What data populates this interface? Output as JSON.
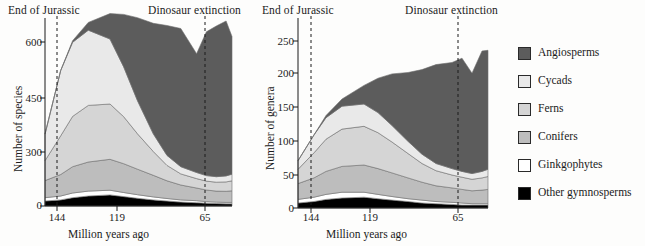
{
  "figure": {
    "axis_x_title": "Million years ago",
    "event_end_jurassic": "End of Jurassic",
    "event_dinosaur_extinction": "Dinosaur extinction",
    "panel_a_letter": "(a)",
    "panel_b_letter": "(b)"
  },
  "legend": {
    "items": [
      {
        "label": "Angiosperms",
        "color": "#5c5c5c",
        "key": "angiosperms"
      },
      {
        "label": "Cycads",
        "color": "#e9e9e9",
        "key": "cycads"
      },
      {
        "label": "Ferns",
        "color": "#d5d5d5",
        "key": "ferns"
      },
      {
        "label": "Conifers",
        "color": "#bdbdbd",
        "key": "conifers"
      },
      {
        "label": "Ginkgophytes",
        "color": "#ffffff",
        "key": "ginkgophytes"
      },
      {
        "label": "Other gymnosperms",
        "color": "#000000",
        "key": "other_gymnosperms"
      }
    ]
  },
  "chart_data": [
    {
      "id": "panel-a",
      "type": "area",
      "stacked": true,
      "title": "",
      "panel_label": "(a)",
      "xlabel": "Million years ago",
      "ylabel": "Number of species",
      "x_reversed": true,
      "xlim": [
        152,
        57
      ],
      "ylim": [
        0,
        680
      ],
      "grid": false,
      "legend_position": "right-outside",
      "xticks": [
        144,
        119,
        65
      ],
      "yticks": [
        0,
        300,
        450,
        600
      ],
      "annotations": [
        {
          "text": "End of Jurassic",
          "x": 144,
          "style": "dashed-vline"
        },
        {
          "text": "Dinosaur extinction",
          "x": 65,
          "style": "dashed-vline"
        }
      ],
      "x": [
        152,
        144,
        138,
        130,
        119,
        112,
        105,
        97,
        90,
        83,
        75,
        70,
        65,
        60,
        57
      ],
      "series": [
        {
          "name": "Other gymnosperms",
          "values": [
            18,
            22,
            30,
            36,
            40,
            34,
            28,
            22,
            18,
            14,
            12,
            10,
            9,
            8,
            8
          ]
        },
        {
          "name": "Ginkgophytes",
          "values": [
            12,
            14,
            17,
            18,
            17,
            15,
            13,
            11,
            9,
            8,
            7,
            6,
            5,
            5,
            5
          ]
        },
        {
          "name": "Conifers",
          "values": [
            62,
            78,
            95,
            105,
            112,
            104,
            92,
            78,
            64,
            54,
            46,
            42,
            40,
            40,
            42
          ]
        },
        {
          "name": "Ferns",
          "values": [
            72,
            140,
            182,
            205,
            200,
            170,
            128,
            86,
            56,
            40,
            34,
            32,
            32,
            34,
            36
          ]
        },
        {
          "name": "Cycads",
          "values": [
            96,
            236,
            268,
            272,
            235,
            180,
            120,
            64,
            36,
            26,
            22,
            20,
            20,
            22,
            24
          ]
        },
        {
          "name": "Angiosperms",
          "values": [
            0,
            0,
            6,
            28,
            92,
            190,
            300,
            400,
            470,
            500,
            430,
            520,
            545,
            560,
            498
          ]
        }
      ]
    },
    {
      "id": "panel-b",
      "type": "area",
      "stacked": true,
      "title": "",
      "panel_label": "(b)",
      "xlabel": "Million years ago",
      "ylabel": "Number of genera",
      "x_reversed": true,
      "xlim": [
        152,
        57
      ],
      "ylim": [
        0,
        265
      ],
      "grid": false,
      "legend_position": "right-outside",
      "xticks": [
        144,
        119,
        65
      ],
      "yticks": [
        0,
        50,
        100,
        150,
        200,
        250
      ],
      "annotations": [
        {
          "text": "End of Jurassic",
          "x": 144,
          "style": "dashed-vline"
        },
        {
          "text": "Dinosaur extinction",
          "x": 65,
          "style": "dashed-vline"
        }
      ],
      "x": [
        152,
        144,
        138,
        130,
        119,
        112,
        105,
        97,
        90,
        83,
        75,
        70,
        65,
        60,
        57
      ],
      "series": [
        {
          "name": "Other gymnosperms",
          "values": [
            7,
            9,
            12,
            14,
            15,
            13,
            11,
            9,
            7,
            6,
            5,
            4,
            4,
            4,
            4
          ]
        },
        {
          "name": "Ginkgophytes",
          "values": [
            5,
            6,
            7,
            8,
            7,
            6,
            5,
            4,
            4,
            3,
            3,
            3,
            2,
            2,
            2
          ]
        },
        {
          "name": "Conifers",
          "values": [
            22,
            27,
            32,
            36,
            38,
            36,
            33,
            29,
            25,
            22,
            20,
            19,
            18,
            19,
            20
          ]
        },
        {
          "name": "Ferns",
          "values": [
            20,
            35,
            45,
            52,
            54,
            50,
            43,
            34,
            26,
            21,
            18,
            17,
            16,
            17,
            18
          ]
        },
        {
          "name": "Cycads",
          "values": [
            12,
            25,
            30,
            32,
            31,
            28,
            23,
            17,
            13,
            10,
            9,
            8,
            8,
            9,
            10
          ]
        },
        {
          "name": "Angiosperms",
          "values": [
            0,
            0,
            3,
            10,
            26,
            48,
            72,
            96,
            118,
            138,
            148,
            158,
            140,
            168,
            166
          ]
        }
      ]
    }
  ]
}
